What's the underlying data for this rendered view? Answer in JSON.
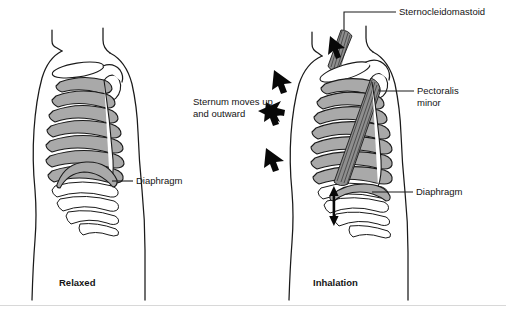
{
  "figure": {
    "title_visible": false,
    "panels": [
      {
        "id": "relaxed",
        "caption": "Relaxed",
        "labels": [
          {
            "name": "diaphragm",
            "text": "Diaphragm"
          }
        ],
        "arrows": []
      },
      {
        "id": "inhalation",
        "caption": "Inhalation",
        "labels": [
          {
            "name": "sternocleidomastoid",
            "text": "Sternocleidomastoid"
          },
          {
            "name": "pectoralis-minor",
            "text": "Pectoralis\nminor",
            "line1": "Pectoralis",
            "line2": "minor"
          },
          {
            "name": "diaphragm",
            "text": "Diaphragm"
          },
          {
            "name": "sternum-movement",
            "text": "Sternum moves up\nand outward",
            "line1": "Sternum moves up",
            "line2": "and outward"
          }
        ],
        "arrows": [
          {
            "name": "chest-arrow-top",
            "direction": "up-right"
          },
          {
            "name": "chest-arrow-upper",
            "direction": "up-right"
          },
          {
            "name": "chest-arrow-middle",
            "direction": "up-right"
          },
          {
            "name": "chest-arrow-lower",
            "direction": "up-right"
          },
          {
            "name": "diaphragm-arrow",
            "direction": "vertical-double"
          },
          {
            "name": "sternum-pointer-arrow",
            "direction": "down-right"
          }
        ]
      }
    ]
  },
  "colors": {
    "ink": "#1a1a1a",
    "rib_fill": "#a9a9a9",
    "muscle_fill": "#8e8e8e",
    "background": "#ffffff",
    "frame": "#d8d8d8"
  }
}
